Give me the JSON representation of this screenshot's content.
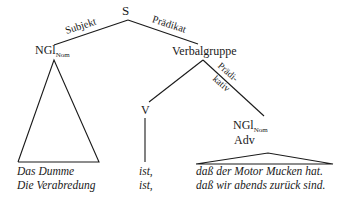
{
  "diagram": {
    "type": "syntax-tree",
    "root": {
      "label": "S"
    },
    "edges": {
      "subject": "Subjekt",
      "predicate": "Prädikat",
      "predicative_line1": "Prädi-",
      "predicative_line2": "kativ"
    },
    "nodes": {
      "subject_np": {
        "label": "NGl",
        "subscript": "Nom"
      },
      "verb_group": {
        "label": "Verbalgruppe"
      },
      "verb": {
        "label": "V"
      },
      "predicative_np": {
        "label": "NGl",
        "subscript": "Nom"
      },
      "predicative_adv": {
        "label": "Adv"
      }
    },
    "sentences": [
      {
        "subject": "Das Dumme",
        "verb": "ist,",
        "clause": "daß der Motor Mucken hat."
      },
      {
        "subject": "Die Verabredung",
        "verb": "ist,",
        "clause": "daß wir abends zurück sind."
      }
    ]
  }
}
